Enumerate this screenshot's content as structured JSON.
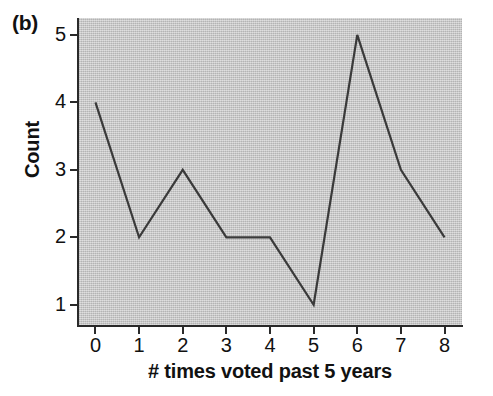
{
  "figure": {
    "panel_label": "(b)",
    "background_color": "#ffffff",
    "plot_background_color": "#c3c3c3",
    "line_color": "#3a3a3a",
    "axis_color": "#2a2a2a",
    "text_color": "#111111"
  },
  "chart_data": {
    "type": "line",
    "title": "",
    "subtitle": "",
    "xlabel": "# times voted past 5 years",
    "ylabel": "Count",
    "x": [
      0,
      1,
      2,
      3,
      4,
      5,
      6,
      7,
      8
    ],
    "values": [
      4,
      2,
      3,
      2,
      2,
      1,
      5,
      3,
      2
    ],
    "series": [
      {
        "name": "Count",
        "values": [
          4,
          2,
          3,
          2,
          2,
          1,
          5,
          3,
          2
        ]
      }
    ],
    "xticklabels": [
      "0",
      "1",
      "2",
      "3",
      "4",
      "5",
      "6",
      "7",
      "8"
    ],
    "yticklabels": [
      "1",
      "2",
      "3",
      "4",
      "5"
    ],
    "xticks": [
      0,
      1,
      2,
      3,
      4,
      5,
      6,
      7,
      8
    ],
    "yticks": [
      1,
      2,
      3,
      4,
      5
    ],
    "xlim": [
      -0.4,
      8.4
    ],
    "ylim": [
      0.7,
      5.25
    ],
    "grid": false,
    "legend": false,
    "legend_position": "none",
    "markers": false,
    "annotations": [
      "(b)"
    ]
  }
}
